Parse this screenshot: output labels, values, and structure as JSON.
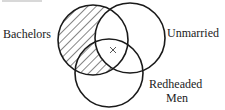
{
  "diagram": {
    "type": "venn",
    "sets": [
      {
        "id": "bachelors",
        "label": "Bachelors",
        "cx": 93,
        "cy": 40,
        "r": 35
      },
      {
        "id": "unmarried",
        "label": "Unmarried",
        "cx": 130,
        "cy": 38,
        "r": 35
      },
      {
        "id": "redheaded",
        "label_line1": "Redheaded",
        "label_line2": "Men",
        "cx": 109,
        "cy": 73,
        "r": 34
      }
    ],
    "shaded_region": "Bachelors minus Unmarried",
    "marker": {
      "symbol": "×",
      "region": "Bachelors ∩ Unmarried ∩ Redheaded Men",
      "x": 113,
      "y": 50
    },
    "colors": {
      "stroke": "#1a1a1a",
      "text": "#222222",
      "background": "#ffffff"
    }
  }
}
